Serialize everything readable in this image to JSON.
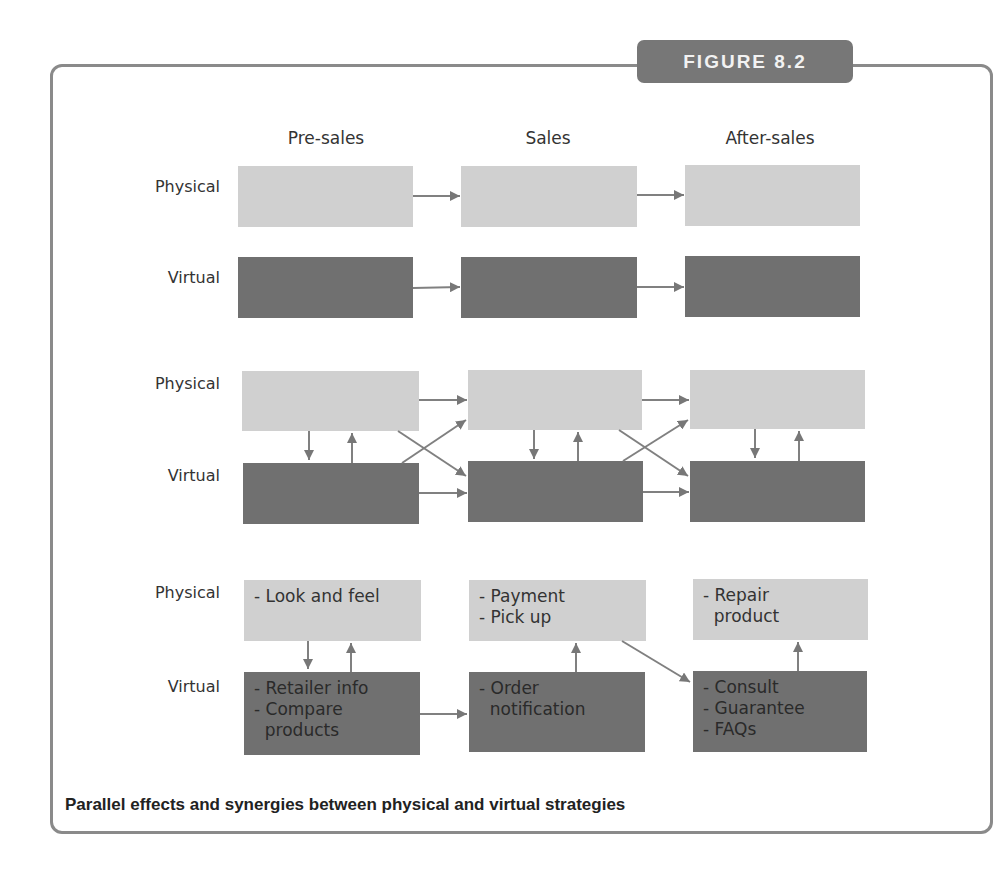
{
  "figure": {
    "badge": "FIGURE 8.2",
    "caption": "Parallel effects and synergies between physical and virtual strategies"
  },
  "columns": [
    "Pre-sales",
    "Sales",
    "After-sales"
  ],
  "row_labels": {
    "physical": "Physical",
    "virtual": "Virtual"
  },
  "panels": [
    {
      "name": "sequential",
      "physical": [
        "",
        "",
        ""
      ],
      "virtual": [
        "",
        "",
        ""
      ]
    },
    {
      "name": "interlinked",
      "physical": [
        "",
        "",
        ""
      ],
      "virtual": [
        "",
        "",
        ""
      ]
    },
    {
      "name": "example",
      "physical": [
        [
          "- Look and feel"
        ],
        [
          "- Payment",
          "- Pick up"
        ],
        [
          "- Repair",
          "  product"
        ]
      ],
      "virtual": [
        [
          "- Retailer info",
          "- Compare",
          "  products"
        ],
        [
          "- Order",
          "  notification"
        ],
        [
          "- Consult",
          "- Guarantee",
          "- FAQs"
        ]
      ]
    }
  ],
  "colors": {
    "physical_box": "#d0d0d0",
    "virtual_box": "#707070",
    "arrow": "#777777",
    "frame": "#8a8a8a",
    "badge": "#777777"
  }
}
